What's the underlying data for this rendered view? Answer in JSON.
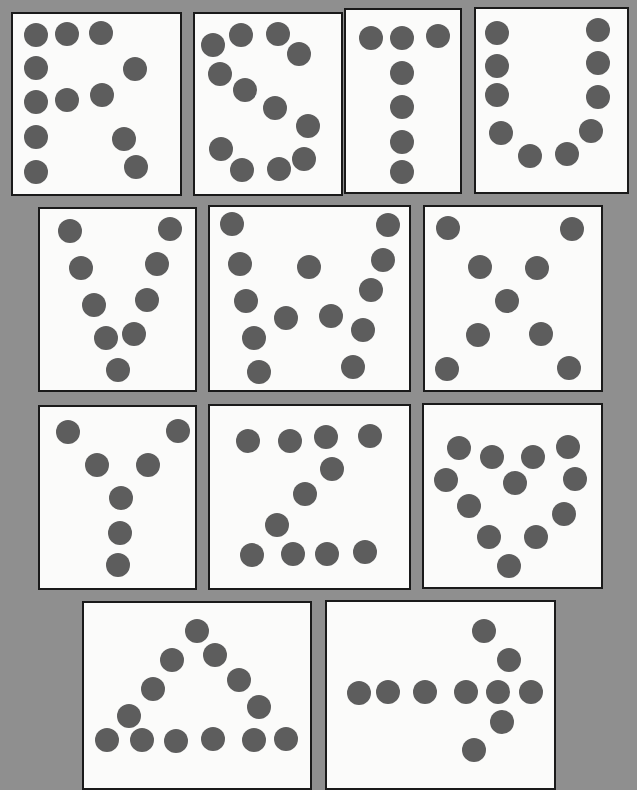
{
  "colors": {
    "background": "#8f8f8f",
    "card": "#fbfbfa",
    "border": "#1a1a1a",
    "dot": "#5d5d5d"
  },
  "cards": [
    {
      "id": "R",
      "label": "R",
      "rect": [
        11,
        12,
        171,
        184
      ],
      "dots": [
        [
          36,
          35
        ],
        [
          67,
          34
        ],
        [
          101,
          33
        ],
        [
          36,
          68
        ],
        [
          135,
          69
        ],
        [
          36,
          102
        ],
        [
          67,
          100
        ],
        [
          102,
          95
        ],
        [
          36,
          137
        ],
        [
          124,
          139
        ],
        [
          36,
          172
        ],
        [
          136,
          167
        ]
      ]
    },
    {
      "id": "S",
      "label": "S",
      "rect": [
        193,
        12,
        150,
        184
      ],
      "dots": [
        [
          213,
          45
        ],
        [
          241,
          35
        ],
        [
          278,
          34
        ],
        [
          299,
          54
        ],
        [
          220,
          74
        ],
        [
          245,
          90
        ],
        [
          275,
          108
        ],
        [
          308,
          126
        ],
        [
          221,
          149
        ],
        [
          242,
          170
        ],
        [
          279,
          169
        ],
        [
          304,
          159
        ]
      ]
    },
    {
      "id": "T",
      "label": "T",
      "rect": [
        344,
        8,
        118,
        186
      ],
      "dots": [
        [
          371,
          38
        ],
        [
          402,
          38
        ],
        [
          438,
          36
        ],
        [
          402,
          73
        ],
        [
          402,
          107
        ],
        [
          402,
          142
        ],
        [
          402,
          172
        ]
      ]
    },
    {
      "id": "U",
      "label": "U",
      "rect": [
        474,
        7,
        155,
        187
      ],
      "dots": [
        [
          497,
          33
        ],
        [
          598,
          30
        ],
        [
          497,
          66
        ],
        [
          598,
          63
        ],
        [
          497,
          95
        ],
        [
          598,
          97
        ],
        [
          501,
          133
        ],
        [
          591,
          131
        ],
        [
          530,
          156
        ],
        [
          567,
          154
        ]
      ]
    },
    {
      "id": "V",
      "label": "V",
      "rect": [
        38,
        207,
        159,
        185
      ],
      "dots": [
        [
          70,
          231
        ],
        [
          170,
          229
        ],
        [
          81,
          268
        ],
        [
          157,
          264
        ],
        [
          94,
          305
        ],
        [
          147,
          300
        ],
        [
          106,
          338
        ],
        [
          134,
          334
        ],
        [
          118,
          370
        ]
      ]
    },
    {
      "id": "W",
      "label": "W",
      "rect": [
        208,
        205,
        203,
        187
      ],
      "dots": [
        [
          232,
          224
        ],
        [
          388,
          225
        ],
        [
          240,
          264
        ],
        [
          309,
          267
        ],
        [
          383,
          260
        ],
        [
          246,
          301
        ],
        [
          371,
          290
        ],
        [
          286,
          318
        ],
        [
          331,
          316
        ],
        [
          254,
          338
        ],
        [
          363,
          330
        ],
        [
          259,
          372
        ],
        [
          353,
          367
        ]
      ]
    },
    {
      "id": "X",
      "label": "X",
      "rect": [
        423,
        205,
        180,
        187
      ],
      "dots": [
        [
          448,
          228
        ],
        [
          572,
          229
        ],
        [
          480,
          267
        ],
        [
          537,
          268
        ],
        [
          507,
          301
        ],
        [
          478,
          335
        ],
        [
          541,
          334
        ],
        [
          447,
          369
        ],
        [
          569,
          368
        ]
      ]
    },
    {
      "id": "Y",
      "label": "Y",
      "rect": [
        38,
        405,
        159,
        185
      ],
      "dots": [
        [
          68,
          432
        ],
        [
          178,
          431
        ],
        [
          97,
          465
        ],
        [
          148,
          465
        ],
        [
          121,
          498
        ],
        [
          120,
          533
        ],
        [
          118,
          565
        ]
      ]
    },
    {
      "id": "Z",
      "label": "Z",
      "rect": [
        208,
        404,
        203,
        186
      ],
      "dots": [
        [
          248,
          441
        ],
        [
          290,
          441
        ],
        [
          326,
          437
        ],
        [
          370,
          436
        ],
        [
          332,
          469
        ],
        [
          305,
          494
        ],
        [
          277,
          525
        ],
        [
          252,
          555
        ],
        [
          293,
          554
        ],
        [
          327,
          554
        ],
        [
          365,
          552
        ]
      ]
    },
    {
      "id": "heart",
      "label": "heart",
      "rect": [
        422,
        403,
        181,
        186
      ],
      "dots": [
        [
          459,
          448
        ],
        [
          492,
          457
        ],
        [
          533,
          457
        ],
        [
          568,
          447
        ],
        [
          446,
          480
        ],
        [
          515,
          483
        ],
        [
          575,
          479
        ],
        [
          469,
          506
        ],
        [
          564,
          514
        ],
        [
          489,
          537
        ],
        [
          536,
          537
        ],
        [
          509,
          566
        ]
      ]
    },
    {
      "id": "triangle",
      "label": "triangle",
      "rect": [
        82,
        601,
        230,
        189
      ],
      "dots": [
        [
          197,
          631
        ],
        [
          172,
          660
        ],
        [
          215,
          655
        ],
        [
          153,
          689
        ],
        [
          239,
          680
        ],
        [
          129,
          716
        ],
        [
          259,
          707
        ],
        [
          107,
          740
        ],
        [
          142,
          740
        ],
        [
          176,
          741
        ],
        [
          213,
          739
        ],
        [
          254,
          740
        ],
        [
          286,
          739
        ]
      ]
    },
    {
      "id": "arrow",
      "label": "arrow",
      "rect": [
        325,
        600,
        231,
        190
      ],
      "dots": [
        [
          484,
          631
        ],
        [
          509,
          660
        ],
        [
          359,
          693
        ],
        [
          388,
          692
        ],
        [
          425,
          692
        ],
        [
          466,
          692
        ],
        [
          498,
          692
        ],
        [
          531,
          692
        ],
        [
          502,
          722
        ],
        [
          474,
          750
        ]
      ]
    }
  ]
}
